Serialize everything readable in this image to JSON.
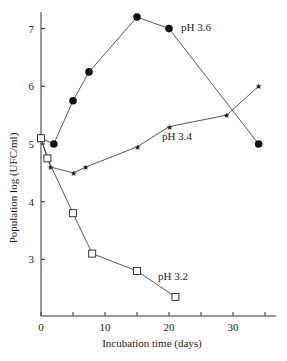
{
  "chart_data": {
    "type": "line",
    "title": "",
    "xlabel": "Incubation time (days)",
    "ylabel": "Population log (UFC/ml)",
    "xlim": [
      0,
      37
    ],
    "ylim": [
      2,
      7.3
    ],
    "xticks": [
      0,
      5,
      10,
      15,
      20,
      25,
      30,
      35
    ],
    "xtick_labels": [
      "0",
      "",
      "10",
      "",
      "20",
      "",
      "30",
      ""
    ],
    "yticks": [
      3,
      4,
      5,
      6,
      7
    ],
    "ytick_labels": [
      "3",
      "4",
      "5",
      "6",
      "7"
    ],
    "grid": false,
    "legend": "inline labels",
    "series": [
      {
        "name": "pH 3.6",
        "marker": "filled-circle",
        "x": [
          0,
          2,
          5,
          7.5,
          15,
          20,
          34
        ],
        "y": [
          5.1,
          5.0,
          5.75,
          6.25,
          7.2,
          7.0,
          5.0
        ],
        "label_pos": [
          20,
          7.0
        ]
      },
      {
        "name": "pH 3.4",
        "marker": "star",
        "x": [
          0,
          1.5,
          5,
          7,
          15,
          20,
          29,
          34
        ],
        "y": [
          5.1,
          4.6,
          4.5,
          4.6,
          4.95,
          5.3,
          5.5,
          6.0
        ],
        "label_pos": [
          20,
          5.3
        ]
      },
      {
        "name": "pH 3.2",
        "marker": "open-square",
        "x": [
          0,
          1,
          5,
          8,
          15,
          21
        ],
        "y": [
          5.1,
          4.75,
          3.8,
          3.1,
          2.8,
          2.35
        ],
        "label_pos": [
          21,
          2.35
        ]
      }
    ]
  },
  "labels": {
    "xlabel": "Incubation time (days)",
    "ylabel": "Population log (UFC/ml)",
    "series_36": "pH 3.6",
    "series_34": "pH 3.4",
    "series_32": "pH 3.2"
  }
}
